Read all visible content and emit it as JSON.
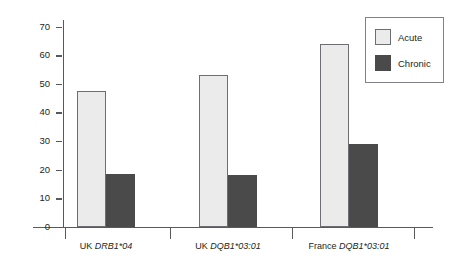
{
  "chart_data": {
    "type": "bar",
    "title": "",
    "xlabel": "",
    "ylabel": "Frequency",
    "categories": [
      "UK DRB1*04",
      "UK DQB1*03:01",
      "France DQB1*03:01"
    ],
    "category_parts": [
      {
        "prefix": "UK",
        "allele": "DRB1*04"
      },
      {
        "prefix": "UK",
        "allele": "DQB1*03:01"
      },
      {
        "prefix": "France",
        "allele": "DQB1*03:01"
      }
    ],
    "series": [
      {
        "name": "Acute",
        "values": [
          47.5,
          53,
          64
        ],
        "color": "#ebebeb"
      },
      {
        "name": "Chronic",
        "values": [
          18.5,
          18,
          29
        ],
        "color": "#4a4a4a"
      }
    ],
    "ylim": [
      0,
      73
    ],
    "yticks": [
      0,
      10,
      20,
      30,
      40,
      50,
      60,
      70
    ],
    "ytick_labels": [
      "0",
      "10",
      "20",
      "30",
      "40",
      "50",
      "60",
      "70"
    ],
    "grid": false,
    "legend_position": "top-right",
    "legend_entries": [
      "Acute",
      "Chronic"
    ]
  },
  "colors": {
    "acute_fill": "#ebebeb",
    "acute_border": "#6d6e71",
    "chronic_fill": "#4a4a4a",
    "axis": "#58595b",
    "text": "#231f20",
    "legend_border": "#808285",
    "background": "#ffffff"
  }
}
